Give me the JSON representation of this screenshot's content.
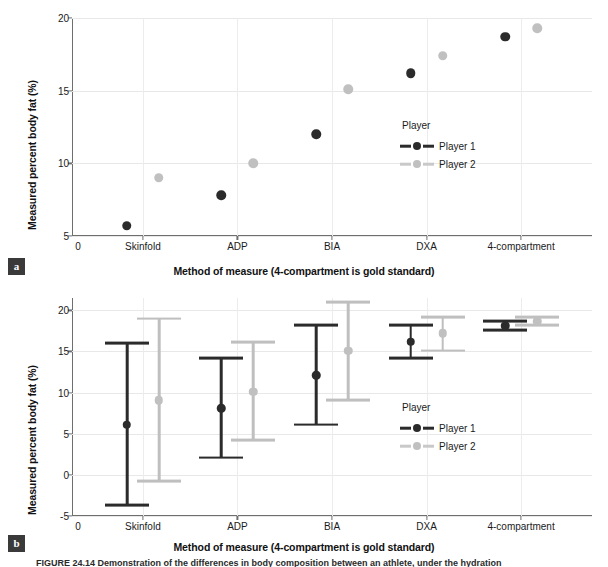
{
  "figure": {
    "caption_partial": "FIGURE 24.14   Demonstration of the differences in body composition between an athlete, under the hydration"
  },
  "panels": [
    {
      "tag": "a",
      "xlabel": "Method of measure (4-compartment is gold standard)",
      "ylabel": "Measured percent body fat (%)"
    },
    {
      "tag": "b",
      "xlabel": "Method of measure (4-compartment is gold standard)",
      "ylabel": "Measured percent body fat (%)"
    }
  ],
  "legend": {
    "title": "Player",
    "entries": [
      {
        "label": "Player 1",
        "color": "#2b2b2b"
      },
      {
        "label": "Player 2",
        "color": "#c0c0c0"
      }
    ]
  },
  "chart_data": [
    {
      "type": "scatter",
      "title": "",
      "xlabel": "Method of measure (4-compartment is gold standard)",
      "ylabel": "Measured percent body fat (%)",
      "categories": [
        "Skinfold",
        "ADP",
        "BIA",
        "DXA",
        "4-compartment"
      ],
      "xtick_labels": [
        "0",
        "Skinfold",
        "ADP",
        "BIA",
        "DXA",
        "4-compartment"
      ],
      "ylim": [
        5,
        20
      ],
      "yticks": [
        5,
        10,
        15,
        20
      ],
      "grid": true,
      "legend_position": "inside-right",
      "series": [
        {
          "name": "Player 1",
          "color": "#2b2b2b",
          "values": [
            5.7,
            7.8,
            12.0,
            16.2,
            18.7
          ]
        },
        {
          "name": "Player 2",
          "color": "#c0c0c0",
          "values": [
            9.0,
            10.0,
            15.1,
            17.4,
            19.3
          ]
        }
      ]
    },
    {
      "type": "scatter",
      "title": "",
      "xlabel": "Method of measure (4-compartment is gold standard)",
      "ylabel": "Measured percent body fat (%)",
      "categories": [
        "Skinfold",
        "ADP",
        "BIA",
        "DXA",
        "4-compartment"
      ],
      "xtick_labels": [
        "0",
        "Skinfold",
        "ADP",
        "BIA",
        "DXA",
        "4-compartment"
      ],
      "ylim": [
        -5,
        21.5
      ],
      "yticks": [
        -5,
        0,
        5,
        10,
        15,
        20
      ],
      "grid": true,
      "legend_position": "inside-right",
      "errorbars": true,
      "series": [
        {
          "name": "Player 1",
          "color": "#2b2b2b",
          "values": [
            6.1,
            8.1,
            12.1,
            16.2,
            18.1
          ],
          "lower": [
            -3.7,
            2.1,
            6.1,
            14.2,
            17.6
          ],
          "upper": [
            16.0,
            14.2,
            18.2,
            18.2,
            18.7
          ]
        },
        {
          "name": "Player 2",
          "color": "#c0c0c0",
          "values": [
            9.1,
            10.1,
            15.1,
            17.2,
            18.7
          ],
          "lower": [
            -0.8,
            4.2,
            9.1,
            15.1,
            18.2
          ],
          "upper": [
            19.0,
            16.1,
            21.0,
            19.2,
            19.2
          ]
        }
      ]
    }
  ]
}
